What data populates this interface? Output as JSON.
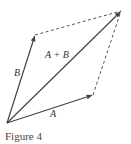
{
  "figure": {
    "caption": "Figure 4",
    "labels": {
      "a": "A",
      "b": "B",
      "sum": "A + B"
    },
    "colors": {
      "vector": "#444444",
      "dashed": "#555555",
      "text": "#333333"
    },
    "points": {
      "origin": [
        7,
        123
      ],
      "a_tip": [
        93,
        95
      ],
      "b_tip": [
        35,
        35
      ],
      "sum_tip": [
        121,
        11
      ]
    }
  }
}
